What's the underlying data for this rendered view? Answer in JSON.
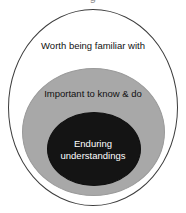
{
  "diagram": {
    "type": "nested-circles",
    "top_cropped_glyph": "g",
    "background_color": "#ffffff",
    "rings": [
      {
        "id": "outer",
        "label": "Worth being familiar with",
        "fill_color": "#ffffff",
        "stroke_color": "#3d3d3d",
        "text_color": "#111111"
      },
      {
        "id": "middle",
        "label": "Important to know & do",
        "fill_color": "#a8a8a8",
        "stroke_color": "#9a9a9a",
        "text_color": "#111111"
      },
      {
        "id": "inner",
        "label_line1": "Enduring",
        "label_line2": "understandings",
        "fill_color": "#141414",
        "stroke_color": "#101010",
        "text_color": "#ffffff"
      }
    ]
  }
}
